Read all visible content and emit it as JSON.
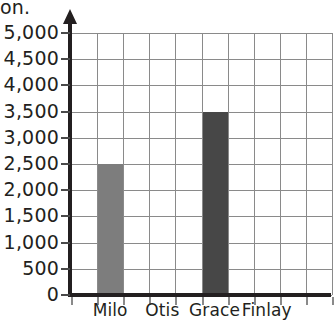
{
  "caption_fragment": "on.",
  "chart_data": {
    "type": "bar",
    "title": "",
    "xlabel": "",
    "ylabel": "",
    "categories": [
      "Milo",
      "Otis",
      "Grace",
      "Finlay"
    ],
    "values": [
      2500,
      0,
      3500,
      0
    ],
    "series": [
      {
        "name": "",
        "values": [
          2500,
          0,
          3500,
          0
        ]
      }
    ],
    "bar_colors": [
      "#7d7d7d",
      "",
      "#474747",
      ""
    ],
    "ylim": [
      0,
      5000
    ],
    "ytick_step": 500,
    "ytick_labels": [
      "0",
      "500",
      "1,000",
      "1,500",
      "2,000",
      "2,500",
      "3,000",
      "3,500",
      "4,000",
      "4,500",
      "5,000"
    ],
    "ytick_values": [
      0,
      500,
      1000,
      1500,
      2000,
      2500,
      3000,
      3500,
      4000,
      4500,
      5000
    ],
    "grid": true,
    "grid_columns": 10,
    "grid_rows": 10,
    "grid_color": "#8a8a8a",
    "axis_color": "#231f20",
    "legend": "none",
    "legend_position": "none",
    "y_axis_arrow": true,
    "cropped_right_edge": true
  }
}
